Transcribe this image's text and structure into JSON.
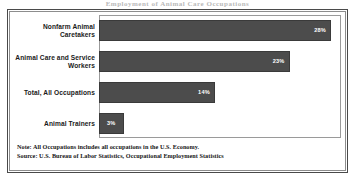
{
  "figure": {
    "cut_title": "Employment of Animal Care Occupations",
    "note": "Note: All Occupations includes all occupations in the U.S. Economy.",
    "source": "Source: U.S. Bureau of Labor Statistics, Occupational Employment Statistics"
  },
  "colors": {
    "bar": "#4c4c4c",
    "bar_border": "#3a3a3a",
    "plot_border": "#9a9a9a",
    "frame_outer": "#4a4a4a",
    "frame_inner": "#8d8d8d",
    "value_text": "#ffffff",
    "label_text": "#1a1a1a"
  },
  "chart_data": {
    "type": "bar",
    "orientation": "horizontal",
    "title": "",
    "xlabel": "",
    "ylabel": "",
    "xlim": [
      0,
      29.3
    ],
    "grid": false,
    "legend": false,
    "categories": [
      "Nonfarm Animal Caretakers",
      "Animal Care and Service Workers",
      "Total, All Occupations",
      "Animal Trainers"
    ],
    "values": [
      28,
      23,
      14,
      3
    ],
    "value_labels": [
      "28%",
      "23%",
      "14%",
      "3%"
    ],
    "units": "percent"
  }
}
